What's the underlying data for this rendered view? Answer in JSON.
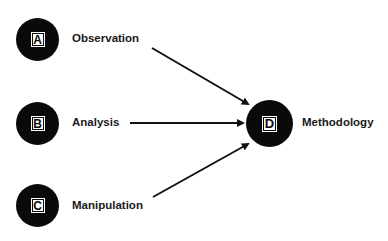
{
  "diagram": {
    "type": "flow",
    "nodes": [
      {
        "id": "A",
        "letter": "A",
        "label": "Observation"
      },
      {
        "id": "B",
        "letter": "B",
        "label": "Analysis"
      },
      {
        "id": "C",
        "letter": "C",
        "label": "Manipulation"
      },
      {
        "id": "D",
        "letter": "D",
        "label": "Methodology"
      }
    ],
    "edges": [
      {
        "from": "A",
        "to": "D"
      },
      {
        "from": "B",
        "to": "D"
      },
      {
        "from": "C",
        "to": "D"
      }
    ],
    "colors": {
      "node_fill": "#0a0a0a",
      "background": "#ffffff",
      "arrow": "#111111"
    }
  }
}
